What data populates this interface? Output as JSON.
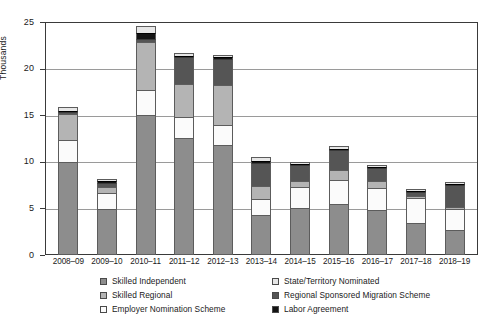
{
  "chart_data": {
    "type": "bar",
    "subtype": "stacked-vertical",
    "title": "",
    "xlabel": "",
    "ylabel": "Thousands",
    "ylim": [
      0,
      25
    ],
    "yticks": [
      "0",
      "5",
      "10",
      "15",
      "20",
      "25"
    ],
    "grid": true,
    "legend_position": "bottom",
    "categories": [
      "2008–09",
      "2009–10",
      "2010–11",
      "2011–12",
      "2012–13",
      "2013–14",
      "2014–15",
      "2015–16",
      "2016–17",
      "2017–18",
      "2018–19"
    ],
    "series": [
      {
        "name": "Skilled Independent",
        "color": "#8d8d8d",
        "values": [
          10.0,
          4.9,
          15.0,
          12.6,
          11.8,
          4.3,
          5.0,
          5.5,
          4.8,
          3.4,
          2.7
        ]
      },
      {
        "name": "Employer Nomination Scheme",
        "color": "#fbfbfb",
        "values": [
          2.3,
          1.8,
          2.7,
          2.2,
          2.1,
          1.7,
          2.3,
          2.5,
          2.4,
          2.7,
          2.2
        ]
      },
      {
        "name": "Skilled Regional",
        "color": "#b4b4b4",
        "values": [
          2.8,
          0.6,
          5.2,
          3.5,
          4.3,
          1.4,
          0.6,
          1.1,
          0.7,
          0.2,
          0.2
        ]
      },
      {
        "name": "Regional Sponsored Migration Scheme",
        "color": "#555555",
        "values": [
          0.3,
          0.4,
          0.3,
          2.9,
          2.8,
          2.5,
          1.8,
          2.2,
          1.4,
          0.5,
          2.4
        ]
      },
      {
        "name": "Labor Agreement",
        "color": "#131313",
        "values": [
          0.1,
          0.2,
          0.6,
          0.2,
          0.2,
          0.2,
          0.1,
          0.1,
          0.1,
          0.1,
          0.1
        ]
      },
      {
        "name": "State/Territory Nominated",
        "color": "#e6e6e6",
        "values": [
          0.4,
          0.3,
          0.8,
          0.3,
          0.3,
          0.4,
          0.2,
          0.3,
          0.3,
          0.2,
          0.2
        ]
      }
    ],
    "totals": [
      15.9,
      8.2,
      24.6,
      21.7,
      21.5,
      10.5,
      10.0,
      11.7,
      9.7,
      7.1,
      7.8
    ]
  },
  "axis": {
    "y_title": "Thousands"
  },
  "legend": {
    "items": [
      {
        "label": "Skilled Independent",
        "swatch": "#8d8d8d",
        "name": "skilled-independent"
      },
      {
        "label": "State/Territory Nominated",
        "swatch": "#e6e6e6",
        "name": "state-territory-nominated"
      },
      {
        "label": "Skilled Regional",
        "swatch": "#b4b4b4",
        "name": "skilled-regional"
      },
      {
        "label": "Regional Sponsored Migration Scheme",
        "swatch": "#555555",
        "name": "regional-sponsored-migration-scheme"
      },
      {
        "label": "Employer Nomination Scheme",
        "swatch": "#fbfbfb",
        "name": "employer-nomination-scheme"
      },
      {
        "label": "Labor Agreement",
        "swatch": "#131313",
        "name": "labor-agreement"
      }
    ]
  }
}
